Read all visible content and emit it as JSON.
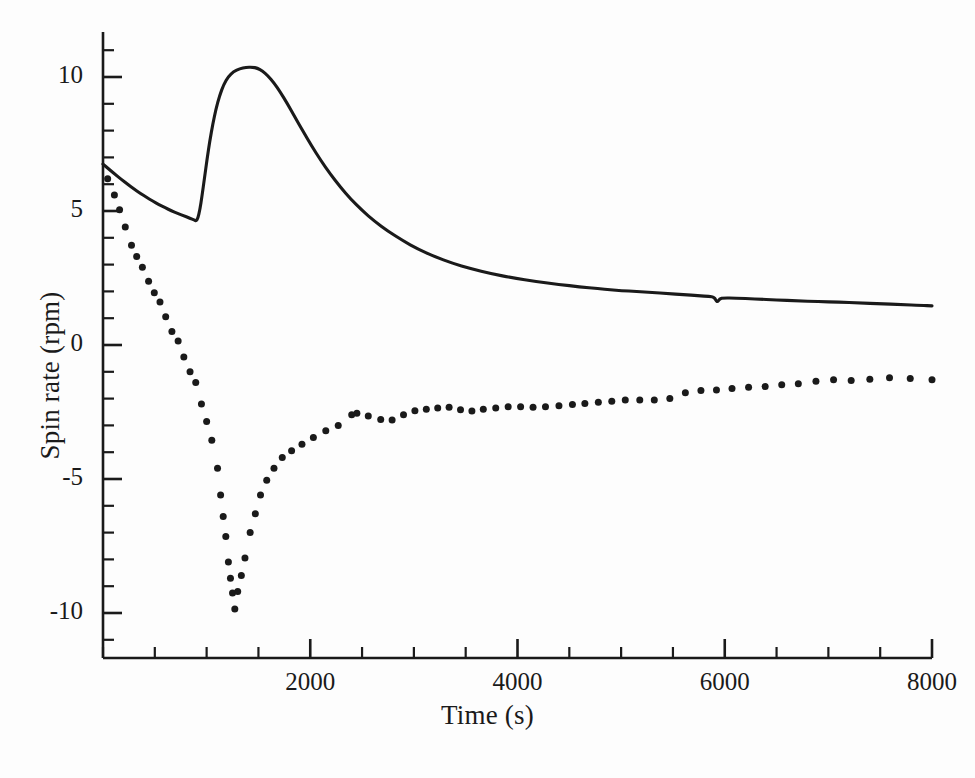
{
  "chart_data": {
    "type": "line",
    "title": "",
    "subtitle": "",
    "xlabel": "Time (s)",
    "ylabel": "Spin rate (rpm)",
    "xlim": [
      0,
      8000
    ],
    "ylim": [
      -11.7,
      11.7
    ],
    "grid": false,
    "legend": "none",
    "background_color": "#fdfdfd",
    "line_color": "#1a1a1a",
    "marker_color": "#1a1a1a",
    "x_major_ticks": [
      2000,
      4000,
      6000,
      8000
    ],
    "x_major_tick_labels": [
      "2000",
      "4000",
      "6000",
      "8000"
    ],
    "x_minor_tick_step": 500,
    "y_major_ticks": [
      -10,
      -5,
      0,
      5,
      10
    ],
    "y_major_tick_labels": [
      "-10",
      "-5",
      "0",
      "5",
      "10"
    ],
    "y_minor_tick_step": 1,
    "series": [
      {
        "name": "solid-curve",
        "style": "solid-line",
        "points": [
          [
            0,
            6.75
          ],
          [
            60,
            6.55
          ],
          [
            120,
            6.36
          ],
          [
            180,
            6.17
          ],
          [
            240,
            5.99
          ],
          [
            300,
            5.82
          ],
          [
            360,
            5.66
          ],
          [
            420,
            5.51
          ],
          [
            480,
            5.37
          ],
          [
            540,
            5.24
          ],
          [
            600,
            5.12
          ],
          [
            660,
            5.01
          ],
          [
            720,
            4.91
          ],
          [
            780,
            4.82
          ],
          [
            840,
            4.73
          ],
          [
            880,
            4.66
          ],
          [
            900,
            4.63
          ],
          [
            915,
            4.72
          ],
          [
            935,
            5.05
          ],
          [
            955,
            5.55
          ],
          [
            980,
            6.25
          ],
          [
            1005,
            6.95
          ],
          [
            1030,
            7.6
          ],
          [
            1060,
            8.25
          ],
          [
            1090,
            8.8
          ],
          [
            1125,
            9.3
          ],
          [
            1165,
            9.72
          ],
          [
            1210,
            10.02
          ],
          [
            1260,
            10.2
          ],
          [
            1320,
            10.31
          ],
          [
            1380,
            10.36
          ],
          [
            1440,
            10.37
          ],
          [
            1490,
            10.33
          ],
          [
            1540,
            10.22
          ],
          [
            1590,
            10.05
          ],
          [
            1650,
            9.78
          ],
          [
            1710,
            9.44
          ],
          [
            1780,
            9.0
          ],
          [
            1850,
            8.52
          ],
          [
            1930,
            7.98
          ],
          [
            2010,
            7.45
          ],
          [
            2100,
            6.9
          ],
          [
            2190,
            6.4
          ],
          [
            2290,
            5.9
          ],
          [
            2390,
            5.45
          ],
          [
            2500,
            5.02
          ],
          [
            2620,
            4.62
          ],
          [
            2750,
            4.25
          ],
          [
            2890,
            3.9
          ],
          [
            3040,
            3.58
          ],
          [
            3200,
            3.3
          ],
          [
            3370,
            3.05
          ],
          [
            3550,
            2.85
          ],
          [
            3750,
            2.66
          ],
          [
            3960,
            2.5
          ],
          [
            4180,
            2.37
          ],
          [
            4400,
            2.26
          ],
          [
            4600,
            2.17
          ],
          [
            4780,
            2.1
          ],
          [
            4900,
            2.06
          ],
          [
            5000,
            2.03
          ],
          [
            5150,
            2.0
          ],
          [
            5300,
            1.96
          ],
          [
            5450,
            1.92
          ],
          [
            5600,
            1.88
          ],
          [
            5750,
            1.84
          ],
          [
            5850,
            1.81
          ],
          [
            5900,
            1.79
          ],
          [
            5925,
            1.58
          ],
          [
            5950,
            1.72
          ],
          [
            5990,
            1.76
          ],
          [
            6100,
            1.75
          ],
          [
            6300,
            1.72
          ],
          [
            6500,
            1.68
          ],
          [
            6700,
            1.65
          ],
          [
            6900,
            1.62
          ],
          [
            7100,
            1.6
          ],
          [
            7300,
            1.57
          ],
          [
            7500,
            1.54
          ],
          [
            7700,
            1.51
          ],
          [
            7900,
            1.48
          ],
          [
            8000,
            1.46
          ]
        ]
      },
      {
        "name": "dotted-series",
        "style": "round-markers",
        "marker_size_px": 7,
        "points": [
          [
            45,
            6.2
          ],
          [
            110,
            5.6
          ],
          [
            160,
            5.05
          ],
          [
            215,
            4.4
          ],
          [
            275,
            3.72
          ],
          [
            325,
            3.3
          ],
          [
            380,
            2.9
          ],
          [
            440,
            2.38
          ],
          [
            495,
            1.95
          ],
          [
            550,
            1.6
          ],
          [
            605,
            1.05
          ],
          [
            665,
            0.5
          ],
          [
            725,
            0.15
          ],
          [
            780,
            -0.45
          ],
          [
            840,
            -1.0
          ],
          [
            895,
            -1.4
          ],
          [
            950,
            -2.2
          ],
          [
            1000,
            -2.85
          ],
          [
            1050,
            -3.55
          ],
          [
            1105,
            -4.6
          ],
          [
            1135,
            -5.6
          ],
          [
            1160,
            -6.4
          ],
          [
            1185,
            -7.15
          ],
          [
            1210,
            -8.1
          ],
          [
            1230,
            -8.7
          ],
          [
            1250,
            -9.25
          ],
          [
            1272,
            -9.85
          ],
          [
            1300,
            -9.2
          ],
          [
            1335,
            -8.6
          ],
          [
            1370,
            -7.95
          ],
          [
            1420,
            -7.0
          ],
          [
            1470,
            -6.3
          ],
          [
            1520,
            -5.6
          ],
          [
            1580,
            -5.05
          ],
          [
            1650,
            -4.6
          ],
          [
            1730,
            -4.2
          ],
          [
            1820,
            -3.95
          ],
          [
            1920,
            -3.7
          ],
          [
            2030,
            -3.45
          ],
          [
            2150,
            -3.2
          ],
          [
            2270,
            -3.0
          ],
          [
            2400,
            -2.6
          ],
          [
            2450,
            -2.55
          ],
          [
            2560,
            -2.65
          ],
          [
            2680,
            -2.78
          ],
          [
            2790,
            -2.8
          ],
          [
            2900,
            -2.6
          ],
          [
            3010,
            -2.45
          ],
          [
            3120,
            -2.4
          ],
          [
            3230,
            -2.35
          ],
          [
            3340,
            -2.32
          ],
          [
            3450,
            -2.42
          ],
          [
            3560,
            -2.46
          ],
          [
            3670,
            -2.4
          ],
          [
            3790,
            -2.35
          ],
          [
            3910,
            -2.3
          ],
          [
            4030,
            -2.3
          ],
          [
            4150,
            -2.32
          ],
          [
            4270,
            -2.3
          ],
          [
            4400,
            -2.27
          ],
          [
            4530,
            -2.22
          ],
          [
            4650,
            -2.18
          ],
          [
            4780,
            -2.14
          ],
          [
            4910,
            -2.1
          ],
          [
            5040,
            -2.05
          ],
          [
            5180,
            -2.05
          ],
          [
            5320,
            -2.05
          ],
          [
            5470,
            -2.0
          ],
          [
            5620,
            -1.78
          ],
          [
            5770,
            -1.7
          ],
          [
            5920,
            -1.68
          ],
          [
            6070,
            -1.62
          ],
          [
            6230,
            -1.58
          ],
          [
            6390,
            -1.55
          ],
          [
            6550,
            -1.48
          ],
          [
            6710,
            -1.45
          ],
          [
            6880,
            -1.35
          ],
          [
            7050,
            -1.3
          ],
          [
            7220,
            -1.32
          ],
          [
            7400,
            -1.28
          ],
          [
            7590,
            -1.22
          ],
          [
            7790,
            -1.25
          ],
          [
            8000,
            -1.3
          ]
        ]
      }
    ]
  },
  "axes": {
    "x_title": "Time (s)",
    "y_title": "Spin rate (rpm)"
  }
}
